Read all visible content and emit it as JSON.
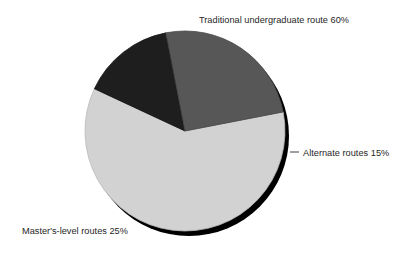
{
  "chart_data": {
    "type": "pie",
    "title": "",
    "subtitle": "",
    "xlabel": "",
    "ylabel": "",
    "grid": false,
    "legend_position": "none",
    "labels_position": "outside-callout-text",
    "background_color": "#ffffff",
    "total": 100,
    "units": "%",
    "geometry": {
      "center_x": 185,
      "center_y": 131,
      "radius": 100,
      "shadow_offset_x": 4,
      "shadow_offset_y": 5,
      "shadow_color": "#000000",
      "start_angle_deg": -11,
      "direction": "clockwise"
    },
    "categories": [
      "Traditional undergraduate route",
      "Alternate routes",
      "Master's-level routes"
    ],
    "values": [
      60,
      15,
      25
    ],
    "colors": [
      "#d2d2d2",
      "#1e1e1e",
      "#575757"
    ],
    "slices": [
      {
        "name": "Traditional undergraduate route",
        "value": 60,
        "value_text": "60%",
        "color": "#d2d2d2",
        "start_angle_deg": 133,
        "end_angle_deg": 349,
        "sweep_deg": 216
      },
      {
        "name": "Alternate routes",
        "value": 15,
        "value_text": "15%",
        "color": "#1e1e1e",
        "start_angle_deg": 349,
        "end_angle_deg": 403,
        "sweep_deg": 54
      },
      {
        "name": "Master's-level routes",
        "value": 25,
        "value_text": "25%",
        "color": "#575757",
        "start_angle_deg": 43,
        "end_angle_deg": 133,
        "sweep_deg": 90
      }
    ]
  },
  "labels": {
    "traditional": "Traditional undergraduate route 60%",
    "alternate": "Alternate routes 15%",
    "masters": "Master's-level routes 25%"
  }
}
